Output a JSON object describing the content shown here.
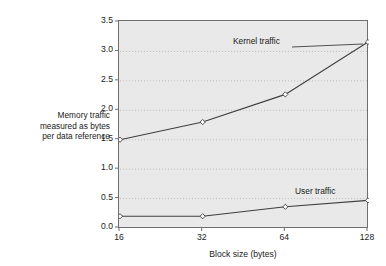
{
  "chart_data": {
    "type": "line",
    "title": "",
    "subtitle": "",
    "xlabel": "Block size (bytes)",
    "ylabel": "Memory traffic measured as bytes per data reference",
    "ylabel_lines": [
      "Memory traffic",
      "measured as bytes",
      "per data reference"
    ],
    "categories": [
      "16",
      "32",
      "64",
      "128"
    ],
    "x": [
      16,
      32,
      64,
      128
    ],
    "xtick_labels": [
      "16",
      "32",
      "64",
      "128"
    ],
    "ytick_labels": [
      "0.0",
      "0.5",
      "1.0",
      "1.5",
      "2.0",
      "2.5",
      "3.0",
      "3.5"
    ],
    "ytick_values": [
      0.0,
      0.5,
      1.0,
      1.5,
      2.0,
      2.5,
      3.0,
      3.5
    ],
    "ylim": [
      0.0,
      3.5
    ],
    "xscale": "log2-categorical",
    "grid": true,
    "grid_axis": "y",
    "legend": "inline-annotations",
    "plot_background": "#e9e9e9",
    "line_color": "#3f3f3f",
    "marker": "open-diamond",
    "marker_fill": "#ffffff",
    "series": [
      {
        "name": "Kernel traffic",
        "annotation": "Kernel traffic",
        "values": [
          1.5,
          1.8,
          2.27,
          3.16
        ]
      },
      {
        "name": "User traffic",
        "annotation": "User traffic",
        "values": [
          0.2,
          0.2,
          0.36,
          0.47
        ]
      }
    ]
  }
}
